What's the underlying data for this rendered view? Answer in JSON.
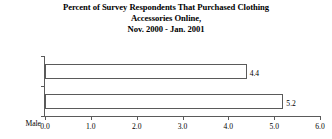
{
  "chart_data": {
    "type": "bar",
    "orientation": "horizontal",
    "title": "Percent of Survey Respondents That Purchased Clothing Accessories Online, Nov. 2000 - Jan. 2001",
    "title_lines": [
      "Percent of Survey Respondents That Purchased Clothing",
      "Accessories Online,",
      "Nov. 2000 - Jan. 2001"
    ],
    "categories": [
      "Male",
      "Female"
    ],
    "values": [
      4.4,
      5.2
    ],
    "value_labels": [
      "4.4",
      "5.2"
    ],
    "xlabel": "",
    "ylabel": "",
    "xlim": [
      0.0,
      6.0
    ],
    "xticks": [
      0.0,
      1.0,
      2.0,
      3.0,
      4.0,
      5.0,
      6.0
    ],
    "xtick_labels": [
      "0.0",
      "1.0",
      "2.0",
      "3.0",
      "4.0",
      "5.0",
      "6.0"
    ],
    "grid": false,
    "legend": false,
    "series": [
      {
        "name": "Percent",
        "values": [
          4.4,
          5.2
        ]
      }
    ],
    "colors": {
      "bar_fill": "#ffffff",
      "bar_border": "#5a5a5a",
      "axis": "#5a5a5a",
      "text": "#000000",
      "background": "#ffffff"
    }
  }
}
